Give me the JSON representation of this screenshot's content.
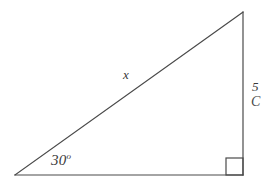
{
  "figure": {
    "kind": "right-triangle-diagram",
    "background_color": "#ffffff",
    "stroke_color": "#4a4a4a",
    "stroke_width": 1.2,
    "vertices": {
      "left": {
        "x": 15,
        "y": 175
      },
      "apex": {
        "x": 243,
        "y": 12
      },
      "right_angle": {
        "x": 243,
        "y": 175
      }
    },
    "right_angle_marker": {
      "x": 226,
      "y": 158,
      "size": 17
    },
    "labels": {
      "angle": "30",
      "angle_degree_symbol": "o",
      "hypotenuse": "x",
      "opposite_side": "5",
      "opposite_side_clipped": "C"
    }
  }
}
